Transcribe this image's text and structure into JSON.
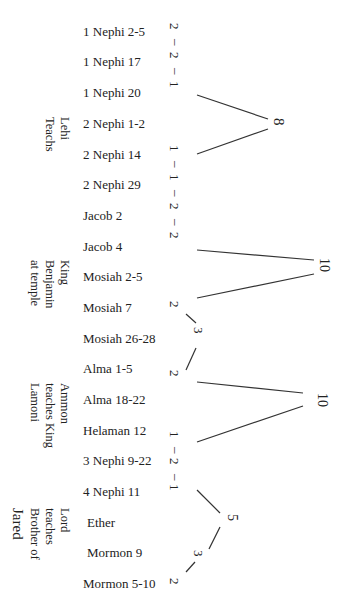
{
  "chapters": [
    {
      "label": "1 Nephi 2-5",
      "count": "2"
    },
    {
      "label": "1 Nephi 17",
      "count": "2"
    },
    {
      "label": "1 Nephi 20",
      "count": "1"
    },
    {
      "label": "2 Nephi 1-2",
      "count": ""
    },
    {
      "label": "2 Nephi 14",
      "count": "1"
    },
    {
      "label": "2 Nephi 29",
      "count": "1"
    },
    {
      "label": "Jacob 2",
      "count": "2"
    },
    {
      "label": "Jacob 4",
      "count": "2"
    },
    {
      "label": "Mosiah 2-5",
      "count": ""
    },
    {
      "label": "Mosiah 7",
      "count": "2"
    },
    {
      "label": "Mosiah 26-28",
      "count": ""
    },
    {
      "label": "Alma 1-5",
      "count": "2"
    },
    {
      "label": "Alma 18-22",
      "count": ""
    },
    {
      "label": "Helaman 12",
      "count": "1"
    },
    {
      "label": "3 Nephi 9-22",
      "count": "2"
    },
    {
      "label": "4 Nephi 11",
      "count": "1"
    },
    {
      "label": "Ether",
      "count": ""
    },
    {
      "label": "Mormon 9",
      "count": ""
    },
    {
      "label": "Mormon 5-10",
      "count": "2"
    }
  ],
  "groups": [
    {
      "lines": "Lehi\nTeachs"
    },
    {
      "lines": "King\nBenjamin\nat temple"
    },
    {
      "lines": "Ammon\nteaches King\nLamoni"
    },
    {
      "lines": "Lord\nteaches\nBrother of"
    },
    {
      "lines": "Jared"
    }
  ],
  "links": {
    "row_numbers": [
      "2",
      "–",
      "2",
      "–",
      "1",
      "1",
      "–",
      "1",
      "–",
      "2",
      "–",
      "2",
      "1",
      "–",
      "2",
      "–",
      "1"
    ],
    "peaks": [
      {
        "value": "8"
      },
      {
        "value": "10"
      },
      {
        "value": "10"
      },
      {
        "value": "5"
      }
    ],
    "mid_nodes": [
      {
        "value": "3"
      },
      {
        "value": "3"
      },
      {
        "value": "2"
      },
      {
        "value": "2"
      },
      {
        "value": "2"
      }
    ]
  }
}
